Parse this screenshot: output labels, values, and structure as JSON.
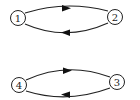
{
  "diagram": {
    "type": "directed-graph",
    "nodes": [
      {
        "id": "1",
        "label": "1",
        "x": 18,
        "y": 18
      },
      {
        "id": "2",
        "label": "2",
        "x": 115,
        "y": 17
      },
      {
        "id": "3",
        "label": "3",
        "x": 117,
        "y": 82
      },
      {
        "id": "4",
        "label": "4",
        "x": 19,
        "y": 85
      }
    ],
    "edges": [
      {
        "from": "1",
        "to": "2",
        "curve": "upper"
      },
      {
        "from": "2",
        "to": "1",
        "curve": "lower"
      },
      {
        "from": "4",
        "to": "3",
        "curve": "upper"
      },
      {
        "from": "3",
        "to": "4",
        "curve": "lower"
      }
    ],
    "colors": {
      "stroke": "#222222",
      "background": "#ffffff"
    }
  }
}
